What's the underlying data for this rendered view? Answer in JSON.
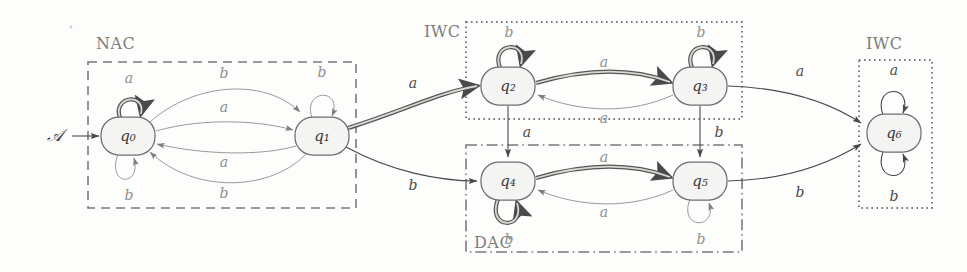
{
  "figure": {
    "type": "finite-state-automaton-diagram",
    "background_color": "#fdfdfc",
    "start_marker_label": "Å",
    "start_marker_text": "𝒜",
    "alphabet": [
      "a",
      "b"
    ]
  },
  "regions": [
    {
      "id": "nac",
      "label": "NAC",
      "border_style": "dashed",
      "color": "#7a7a7a",
      "x": 88,
      "y": 62,
      "w": 268,
      "h": 146,
      "label_x": 96,
      "label_y": 44
    },
    {
      "id": "iwc1",
      "label": "IWC",
      "border_style": "dotted",
      "color": "#7a7a7a",
      "x": 466,
      "y": 22,
      "w": 276,
      "h": 97,
      "label_x": 424,
      "label_y": 32
    },
    {
      "id": "dac",
      "label": "DAC",
      "border_style": "dashdot",
      "color": "#7a7a7a",
      "x": 466,
      "y": 145,
      "w": 276,
      "h": 107,
      "label_x": 474,
      "label_y": 243
    },
    {
      "id": "iwc2",
      "label": "IWC",
      "border_style": "dotted",
      "color": "#7a7a7a",
      "x": 859,
      "y": 60,
      "w": 73,
      "h": 148,
      "label_x": 866,
      "label_y": 44
    }
  ],
  "states": [
    {
      "id": "q0",
      "label": "q₀",
      "x": 128,
      "y": 136,
      "rx": 27,
      "ry": 19
    },
    {
      "id": "q1",
      "label": "q₁",
      "x": 322,
      "y": 136,
      "rx": 27,
      "ry": 19
    },
    {
      "id": "q2",
      "label": "q₂",
      "x": 508,
      "y": 86,
      "rx": 27,
      "ry": 19
    },
    {
      "id": "q3",
      "label": "q₃",
      "x": 700,
      "y": 86,
      "rx": 27,
      "ry": 19
    },
    {
      "id": "q4",
      "label": "q₄",
      "x": 508,
      "y": 181,
      "rx": 27,
      "ry": 19
    },
    {
      "id": "q5",
      "label": "q₅",
      "x": 700,
      "y": 181,
      "rx": 27,
      "ry": 19
    },
    {
      "id": "q6",
      "label": "q₆",
      "x": 894,
      "y": 133,
      "rx": 27,
      "ry": 19
    }
  ],
  "transitions": [
    {
      "from": "start",
      "to": "q0",
      "label": "",
      "style": "thin",
      "label_x": 0,
      "label_y": 0
    },
    {
      "from": "q0",
      "to": "q0",
      "label": "a",
      "style": "highlighted",
      "label_x": 129,
      "label_y": 79,
      "position": "top"
    },
    {
      "from": "q0",
      "to": "q0",
      "label": "b",
      "style": "faint",
      "label_x": 129,
      "label_y": 196,
      "position": "bottom"
    },
    {
      "from": "q0",
      "to": "q1",
      "label": "b",
      "style": "faint",
      "label_x": 224,
      "label_y": 74,
      "position": "arc-top-outer"
    },
    {
      "from": "q0",
      "to": "q1",
      "label": "a",
      "style": "faint",
      "label_x": 224,
      "label_y": 108,
      "position": "arc-top-inner"
    },
    {
      "from": "q1",
      "to": "q0",
      "label": "a",
      "style": "faint",
      "label_x": 224,
      "label_y": 163,
      "position": "arc-bottom-inner"
    },
    {
      "from": "q1",
      "to": "q0",
      "label": "b",
      "style": "faint",
      "label_x": 224,
      "label_y": 194,
      "position": "arc-bottom-outer"
    },
    {
      "from": "q1",
      "to": "q1",
      "label": "b",
      "style": "faint",
      "label_x": 322,
      "label_y": 73,
      "position": "top"
    },
    {
      "from": "q1",
      "to": "q2",
      "label": "a",
      "style": "highlighted",
      "label_x": 413,
      "label_y": 84
    },
    {
      "from": "q1",
      "to": "q4",
      "label": "b",
      "style": "thin",
      "label_x": 413,
      "label_y": 186
    },
    {
      "from": "q2",
      "to": "q2",
      "label": "b",
      "style": "highlighted",
      "label_x": 509,
      "label_y": 33,
      "position": "top"
    },
    {
      "from": "q2",
      "to": "q3",
      "label": "a",
      "style": "highlighted",
      "label_x": 604,
      "label_y": 63
    },
    {
      "from": "q3",
      "to": "q2",
      "label": "a",
      "style": "faint",
      "label_x": 604,
      "label_y": 119
    },
    {
      "from": "q3",
      "to": "q3",
      "label": "b",
      "style": "highlighted",
      "label_x": 701,
      "label_y": 33,
      "position": "top"
    },
    {
      "from": "q2",
      "to": "q4",
      "label": "a",
      "style": "thin",
      "label_x": 527,
      "label_y": 133
    },
    {
      "from": "q3",
      "to": "q5",
      "label": "b",
      "style": "thin",
      "label_x": 719,
      "label_y": 133
    },
    {
      "from": "q4",
      "to": "q4",
      "label": "b",
      "style": "highlighted",
      "label_x": 509,
      "label_y": 240,
      "position": "bottom"
    },
    {
      "from": "q4",
      "to": "q5",
      "label": "a",
      "style": "highlighted",
      "label_x": 604,
      "label_y": 158
    },
    {
      "from": "q5",
      "to": "q4",
      "label": "a",
      "style": "faint",
      "label_x": 604,
      "label_y": 213
    },
    {
      "from": "q5",
      "to": "q5",
      "label": "b",
      "style": "faint",
      "label_x": 701,
      "label_y": 240,
      "position": "bottom"
    },
    {
      "from": "q3",
      "to": "q6",
      "label": "a",
      "style": "thin",
      "label_x": 800,
      "label_y": 72
    },
    {
      "from": "q5",
      "to": "q6",
      "label": "b",
      "style": "thin",
      "label_x": 800,
      "label_y": 193
    },
    {
      "from": "q6",
      "to": "q6",
      "label": "a",
      "style": "thin",
      "label_x": 894,
      "label_y": 71,
      "position": "top"
    },
    {
      "from": "q6",
      "to": "q6",
      "label": "b",
      "style": "thin",
      "label_x": 894,
      "label_y": 197,
      "position": "bottom"
    }
  ],
  "start_arrow": {
    "label": "𝒜",
    "label_x": 55,
    "label_y": 136,
    "from_x": 72,
    "to_x": 99,
    "y": 136
  }
}
